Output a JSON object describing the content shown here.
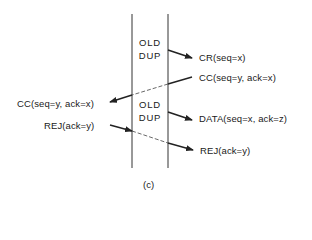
{
  "diagram": {
    "caption": "(c)",
    "old_dup_top": {
      "line1": "OLD",
      "line2": "DUP"
    },
    "old_dup_bottom": {
      "line1": "OLD",
      "line2": "DUP"
    },
    "messages": [
      {
        "id": "cr",
        "label": "CR(seq=x)",
        "direction": "right",
        "style": "solid"
      },
      {
        "id": "cc_right",
        "label": "CC(seq=y, ack=x)",
        "direction": "left",
        "style": "solid-dashed"
      },
      {
        "id": "cc_left",
        "label": "CC(seq=y, ack=x)",
        "direction": "left"
      },
      {
        "id": "data",
        "label": "DATA(seq=x, ack=z)",
        "direction": "right",
        "style": "solid"
      },
      {
        "id": "rej_left",
        "label": "REJ(ack=y)",
        "direction": "right",
        "style": "solid-dashed"
      },
      {
        "id": "rej_right",
        "label": "REJ(ack=y)",
        "direction": "right"
      }
    ],
    "colors": {
      "line": "#222222",
      "text": "#1a1a1a",
      "background": "#ffffff"
    }
  }
}
